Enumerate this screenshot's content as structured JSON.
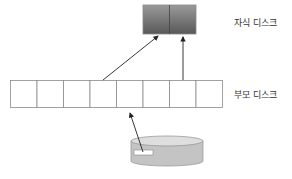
{
  "child_disk": {
    "label": "자식 디스크",
    "blocks": 2,
    "fill_top": "#9a9a9a",
    "fill_bottom": "#5a5a5a"
  },
  "parent_disk": {
    "label": "부모 디스크",
    "blocks": 8
  },
  "base_image": {
    "shape": "cylinder",
    "fill": "#c8c8c8"
  },
  "arrows": [
    {
      "from": "parent_disk.block_4",
      "to": "child_disk.block_1"
    },
    {
      "from": "parent_disk.block_7",
      "to": "child_disk.block_2"
    },
    {
      "from": "base_image",
      "to": "parent_disk.block_5"
    }
  ]
}
